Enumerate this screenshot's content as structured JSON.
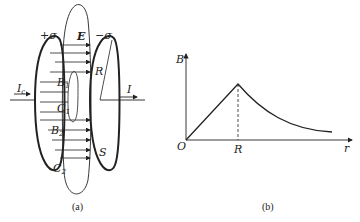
{
  "figure_a": {
    "caption": "(a)",
    "labels": {
      "plus_sigma": "+σ",
      "minus_sigma": "−σ",
      "field": "E",
      "radius": "R",
      "current_in": "I",
      "current_in_sub": "c",
      "current_out": "I",
      "b1": "B",
      "b1_sub": "1",
      "c1": "C",
      "c1_sub": "1",
      "b2": "B",
      "b2_sub": "2",
      "c2": "C",
      "c2_sub": "2",
      "surface": "S"
    }
  },
  "figure_b": {
    "caption": "(b)",
    "y_axis_label": "B",
    "x_axis_label": "r",
    "origin_label": "O",
    "peak_label": "R"
  },
  "colors": {
    "ink": "#222222",
    "background": "#ffffff"
  }
}
